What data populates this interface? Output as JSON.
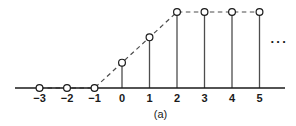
{
  "figure": {
    "caption": "(a)",
    "ellipsis": "···",
    "axis_color": "#1a1a1a",
    "stem_color": "#4d4d4d",
    "envelope_color": "#4d4d4d",
    "marker_fill": "#ffffff",
    "marker_stroke": "#1a1a1a",
    "background": "#ffffff"
  },
  "chart_data": {
    "type": "scatter",
    "title": "",
    "subtitle": "",
    "xlabel": "",
    "ylabel": "",
    "legend": [],
    "grid": false,
    "x": [
      -3,
      -2,
      -1,
      0,
      1,
      2,
      3,
      4,
      5
    ],
    "tick_labels": [
      "−3",
      "−2",
      "−1",
      "0",
      "1",
      "2",
      "3",
      "4",
      "5"
    ],
    "values": [
      0,
      0,
      0,
      0.3333,
      0.6667,
      1,
      1,
      1,
      1
    ],
    "xlim": [
      -3.6,
      5.9
    ],
    "ylim": [
      0,
      1.05
    ],
    "stems": true,
    "markers": "open-circle",
    "envelope": "dashed",
    "annotations": [
      "···"
    ]
  }
}
